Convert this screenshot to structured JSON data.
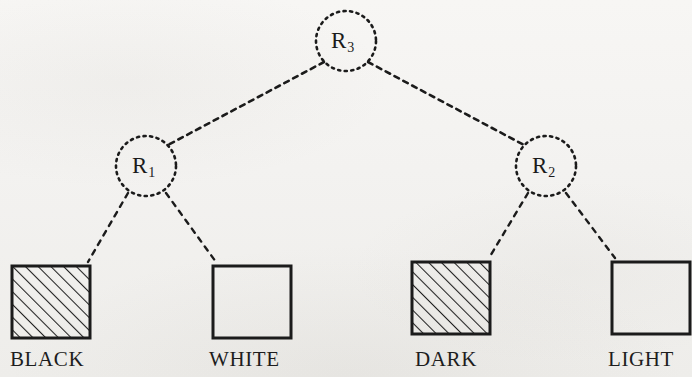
{
  "figure": {
    "type": "tree-diagram",
    "background_color": "#f4f3f1",
    "ink_color": "#1b1b1b",
    "nodes": [
      {
        "id": "R3",
        "label_base": "R",
        "label_sub": "3",
        "role": "root",
        "cx": 346,
        "cy": 41,
        "r": 30
      },
      {
        "id": "R1",
        "label_base": "R",
        "label_sub": "1",
        "role": "left-child",
        "cx": 146,
        "cy": 166,
        "r": 30
      },
      {
        "id": "R2",
        "label_base": "R",
        "label_sub": "2",
        "role": "right-child",
        "cx": 546,
        "cy": 166,
        "r": 30
      }
    ],
    "edges": [
      {
        "from": "R3",
        "to": "R1",
        "style": "dashed"
      },
      {
        "from": "R3",
        "to": "R2",
        "style": "dashed"
      },
      {
        "from": "R1",
        "to": "BLACK",
        "style": "dashed"
      },
      {
        "from": "R1",
        "to": "WHITE",
        "style": "dashed"
      },
      {
        "from": "R2",
        "to": "DARK",
        "style": "dashed"
      },
      {
        "from": "R2",
        "to": "LIGHT",
        "style": "dashed"
      }
    ],
    "leaves": [
      {
        "id": "BLACK",
        "caption": "BLACK",
        "fill": "hatched",
        "x": 12,
        "y": 266,
        "w": 78,
        "h": 72,
        "caption_x": 10,
        "caption_y": 349
      },
      {
        "id": "WHITE",
        "caption": "WHITE",
        "fill": "empty",
        "x": 213,
        "y": 266,
        "w": 78,
        "h": 72,
        "caption_x": 209,
        "caption_y": 349
      },
      {
        "id": "DARK",
        "caption": "DARK",
        "fill": "hatched",
        "x": 412,
        "y": 262,
        "w": 78,
        "h": 72,
        "caption_x": 415,
        "caption_y": 349
      },
      {
        "id": "LIGHT",
        "caption": "LIGHT",
        "fill": "empty",
        "x": 612,
        "y": 262,
        "w": 78,
        "h": 72,
        "caption_x": 608,
        "caption_y": 349
      }
    ]
  }
}
